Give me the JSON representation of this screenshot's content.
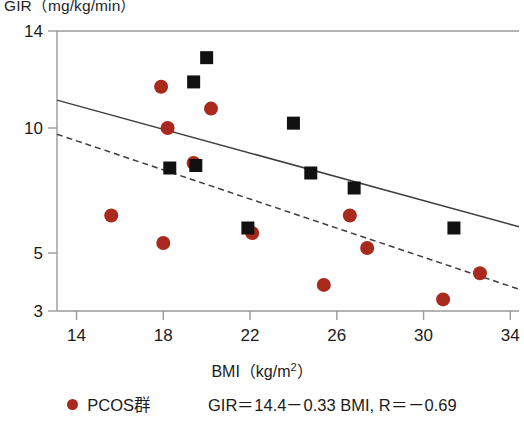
{
  "chart_data": {
    "type": "scatter",
    "title": "",
    "ylabel": "GIR（mg/kg/min）",
    "xlabel_text": "BMI（kg/m",
    "xlabel_sup": "2",
    "xlabel_tail": "）",
    "xlabel": "BMI（kg/m2）",
    "xlim": [
      13.1,
      34.4
    ],
    "ylim": [
      3,
      14
    ],
    "xticks": [
      14,
      18,
      22,
      26,
      30,
      34
    ],
    "yticks": [
      14,
      10,
      5,
      3
    ],
    "grid": false,
    "legend_position": "below-plot",
    "series": [
      {
        "name": "PCOS群",
        "marker": "circle",
        "color": "#a9291c",
        "points": [
          {
            "x": 15.6,
            "y": 6.5
          },
          {
            "x": 17.9,
            "y": 11.7
          },
          {
            "x": 18.0,
            "y": 5.4
          },
          {
            "x": 18.2,
            "y": 10.0
          },
          {
            "x": 19.4,
            "y": 8.6
          },
          {
            "x": 20.2,
            "y": 10.8
          },
          {
            "x": 22.1,
            "y": 5.8
          },
          {
            "x": 25.4,
            "y": 3.9
          },
          {
            "x": 26.6,
            "y": 6.5
          },
          {
            "x": 27.4,
            "y": 5.2
          },
          {
            "x": 30.9,
            "y": 3.4
          },
          {
            "x": 32.6,
            "y": 4.3
          }
        ]
      },
      {
        "name": "control",
        "marker": "square",
        "color": "#111111",
        "points": [
          {
            "x": 18.3,
            "y": 8.4
          },
          {
            "x": 19.4,
            "y": 11.9
          },
          {
            "x": 19.5,
            "y": 8.5
          },
          {
            "x": 20.0,
            "y": 12.9
          },
          {
            "x": 21.9,
            "y": 6.0
          },
          {
            "x": 24.0,
            "y": 10.2
          },
          {
            "x": 24.8,
            "y": 8.2
          },
          {
            "x": 26.8,
            "y": 7.6
          },
          {
            "x": 31.4,
            "y": 6.0
          }
        ]
      }
    ],
    "fit_lines": [
      {
        "name": "control-fit",
        "style": "solid",
        "color": "#3d3d3d",
        "x0": 13.1,
        "y0": 11.15,
        "x1": 34.4,
        "y1": 6.05
      },
      {
        "name": "pcos-fit",
        "style": "dashed",
        "color": "#3d3d3d",
        "x0": 13.1,
        "y0": 9.75,
        "x1": 34.4,
        "y1": 3.75
      }
    ],
    "annotations": [
      "GIR＝14.4－0.33 BMI, R＝－0.69"
    ]
  },
  "legend": {
    "marker_color": "#a9291c",
    "label": "PCOS群",
    "equation": "GIR＝14.4－0.33 BMI, R＝－0.69"
  },
  "axes": {
    "y_caption": "GIR（mg/kg/min）",
    "x_caption_main": "BMI（kg/m",
    "x_caption_sup": "2",
    "x_caption_tail": "）",
    "ytick_labels": [
      "14",
      "10",
      "5",
      "3"
    ],
    "xtick_labels": [
      "14",
      "18",
      "22",
      "26",
      "30",
      "34"
    ]
  }
}
